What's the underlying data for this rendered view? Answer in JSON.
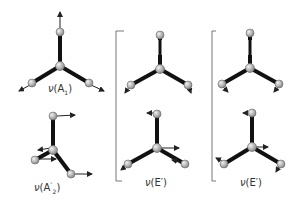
{
  "diagram": {
    "type": "vibrational-modes",
    "colors": {
      "bond": "#111111",
      "atom": "#b8b8b8",
      "atom_stroke": "#666666",
      "arrow": "#222222",
      "bracket": "#555555"
    },
    "modes": [
      {
        "id": "A1",
        "label_nu": "ν",
        "label_open": "(A",
        "label_sub": "1",
        "label_close": ")"
      },
      {
        "id": "A2pp",
        "label_nu": "ν",
        "label_open": "(A",
        "label_sup": "″",
        "label_sub": "2",
        "label_close": ")"
      },
      {
        "id": "E1",
        "label_nu": "ν",
        "label_text": "(E′)"
      },
      {
        "id": "E2",
        "label_nu": "ν",
        "label_text": "(E′)"
      }
    ]
  }
}
